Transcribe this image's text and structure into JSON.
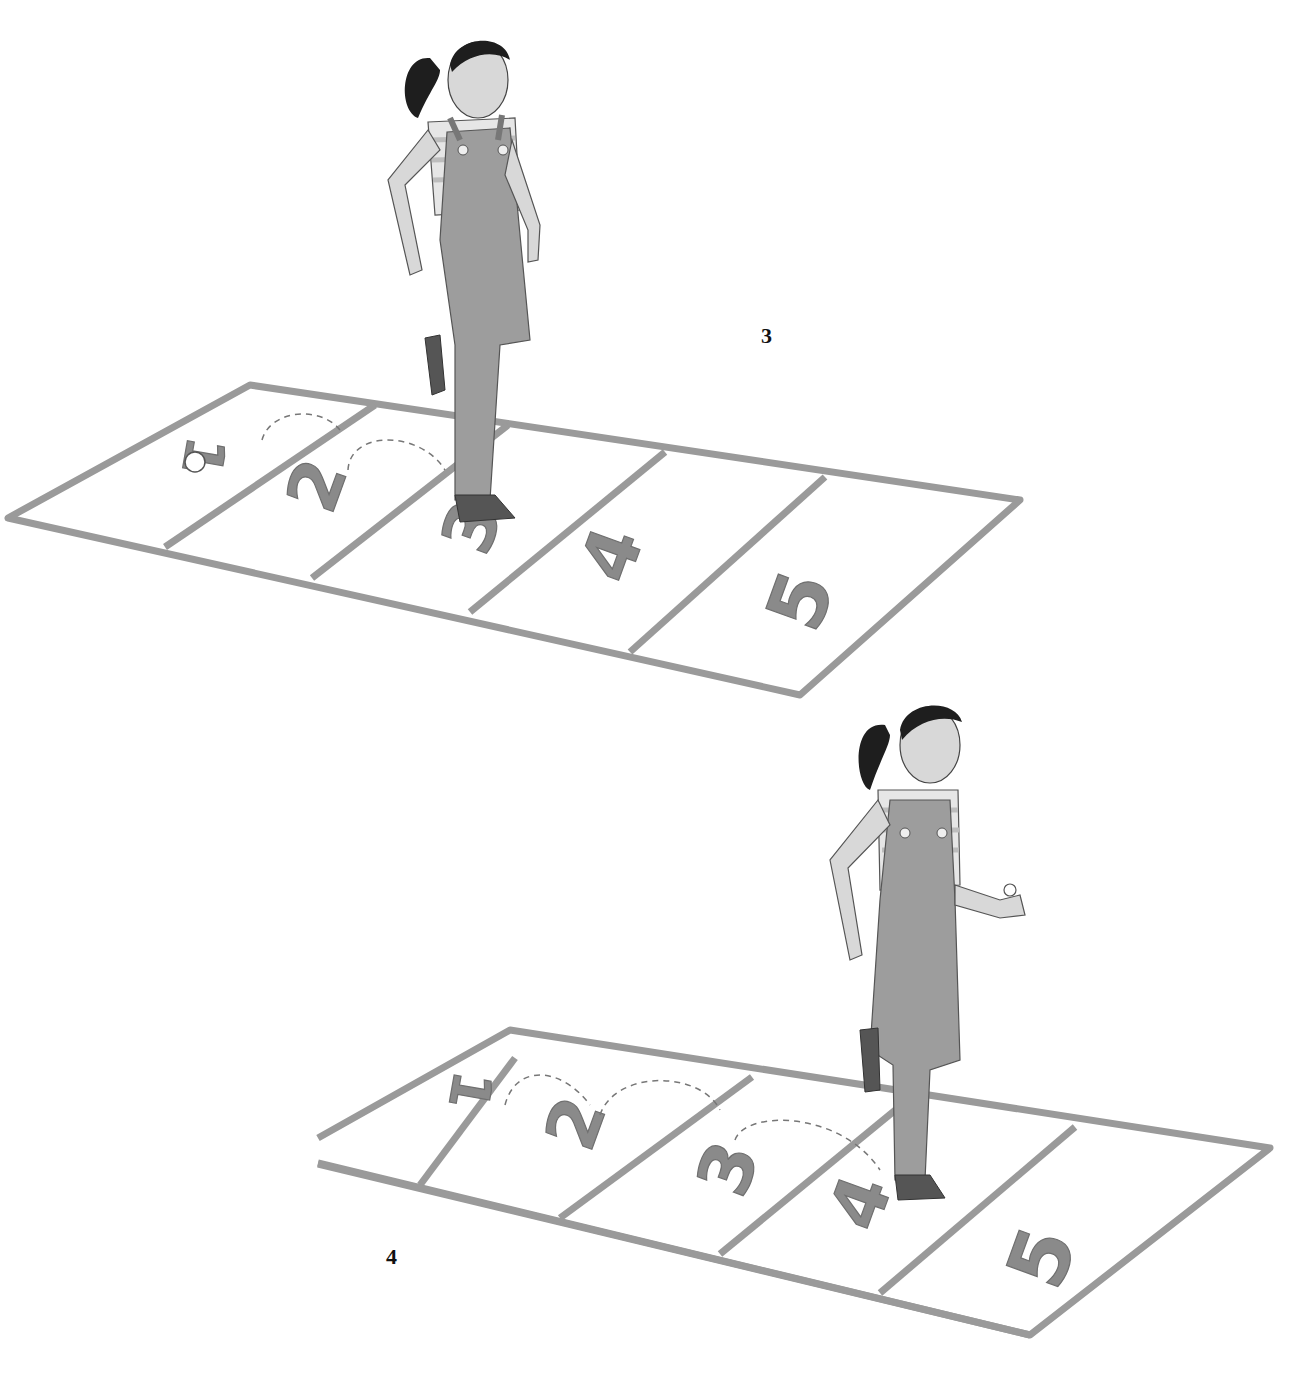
{
  "illustration": {
    "description": "Two-step hopscotch instruction illustration",
    "colors": {
      "background": "#ffffff",
      "grid_line": "#9a9a9a",
      "number_fill": "#8a8a8a",
      "overalls": "#9d9d9d",
      "hair": "#1e1e1e",
      "skin": "#d8d8d8",
      "label": "#111111"
    },
    "steps": [
      {
        "label": "3",
        "squares": [
          "1",
          "2",
          "3",
          "4",
          "5"
        ],
        "stone_on_square": "1",
        "girl_standing_on": "3"
      },
      {
        "label": "4",
        "squares": [
          "1",
          "2",
          "3",
          "4",
          "5"
        ],
        "girl_standing_on": "4",
        "stone_in_hand": true
      }
    ]
  }
}
